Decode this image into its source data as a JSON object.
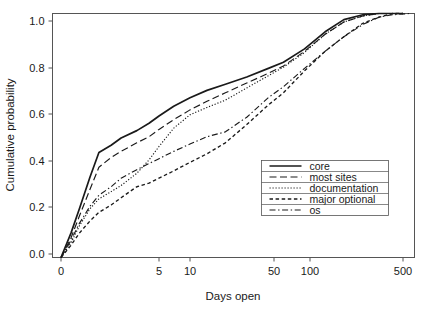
{
  "chart_data": {
    "type": "line",
    "title": "",
    "subtitle": "",
    "xlabel": "Days open",
    "ylabel": "Cumulative probability",
    "grid": false,
    "legend_position": "bottom-right",
    "x_scale": "log-like",
    "xlim": [
      0,
      560
    ],
    "ylim": [
      0.0,
      1.0
    ],
    "x_ticks": [
      {
        "value": 0,
        "label": "0",
        "px": 61
      },
      {
        "value": 5,
        "label": "5",
        "px": 159
      },
      {
        "value": 10,
        "label": "10",
        "px": 190
      },
      {
        "value": 50,
        "label": "50",
        "px": 274
      },
      {
        "value": 100,
        "label": "100",
        "px": 310
      },
      {
        "value": 500,
        "label": "500",
        "px": 403
      }
    ],
    "y_ticks": [
      {
        "value": 0.0,
        "label": "0.0",
        "px": 254
      },
      {
        "value": 0.2,
        "label": "0.2",
        "px": 207
      },
      {
        "value": 0.4,
        "label": "0.4",
        "px": 161
      },
      {
        "value": 0.6,
        "label": "0.6",
        "px": 114
      },
      {
        "value": 0.8,
        "label": "0.8",
        "px": 68
      },
      {
        "value": 1.0,
        "label": "1.0",
        "px": 21
      }
    ],
    "series": [
      {
        "name": "core",
        "dash": "solid",
        "dasharray": "",
        "width": 1.7,
        "x": [
          0,
          0.2,
          0.4,
          0.7,
          1,
          1.5,
          2,
          3,
          4,
          5,
          7,
          10,
          14,
          20,
          30,
          45,
          60,
          90,
          130,
          180,
          250,
          330,
          420,
          500
        ],
        "y": [
          0.0,
          0.1,
          0.2,
          0.33,
          0.43,
          0.46,
          0.49,
          0.52,
          0.55,
          0.58,
          0.62,
          0.655,
          0.685,
          0.71,
          0.74,
          0.775,
          0.8,
          0.855,
          0.925,
          0.975,
          0.995,
          1.0,
          1.0,
          1.0
        ]
      },
      {
        "name": "most sites",
        "dash": "longdash",
        "dasharray": "7,3.5",
        "width": 1.15,
        "x": [
          0,
          0.2,
          0.4,
          0.7,
          1,
          1.5,
          2,
          3,
          4,
          5,
          7,
          10,
          14,
          20,
          30,
          45,
          60,
          90,
          130,
          180,
          250,
          330,
          420,
          500
        ],
        "y": [
          0.0,
          0.08,
          0.17,
          0.28,
          0.37,
          0.41,
          0.435,
          0.47,
          0.495,
          0.525,
          0.565,
          0.605,
          0.64,
          0.675,
          0.715,
          0.755,
          0.785,
          0.845,
          0.915,
          0.965,
          0.99,
          1.0,
          1.0,
          1.0
        ]
      },
      {
        "name": "documentation",
        "dash": "dotted",
        "dasharray": "1.2,1.8",
        "width": 1.15,
        "x": [
          0,
          0.2,
          0.4,
          0.7,
          1,
          1.5,
          2,
          3,
          4,
          5,
          7,
          10,
          14,
          20,
          30,
          45,
          60,
          90,
          130,
          180,
          250,
          330,
          420,
          500
        ],
        "y": [
          0.0,
          0.06,
          0.13,
          0.2,
          0.24,
          0.27,
          0.295,
          0.345,
          0.4,
          0.455,
          0.53,
          0.585,
          0.615,
          0.645,
          0.695,
          0.745,
          0.78,
          0.84,
          0.915,
          0.965,
          0.99,
          1.0,
          1.0,
          1.0
        ]
      },
      {
        "name": "major optional",
        "dash": "dashed",
        "dasharray": "3.5,2.6",
        "width": 1.35,
        "x": [
          0,
          0.2,
          0.4,
          0.7,
          1,
          1.5,
          2,
          3,
          4,
          5,
          7,
          10,
          14,
          20,
          30,
          45,
          60,
          90,
          130,
          180,
          250,
          330,
          420,
          500
        ],
        "y": [
          0.0,
          0.05,
          0.1,
          0.15,
          0.185,
          0.215,
          0.245,
          0.29,
          0.305,
          0.325,
          0.355,
          0.39,
          0.425,
          0.47,
          0.545,
          0.625,
          0.675,
          0.765,
          0.845,
          0.905,
          0.96,
          0.985,
          1.0,
          1.0
        ]
      },
      {
        "name": "os",
        "dash": "dashdot",
        "dasharray": "6,2.6,1.4,2.6",
        "width": 1.15,
        "x": [
          0,
          0.2,
          0.4,
          0.7,
          1,
          1.5,
          2,
          3,
          4,
          5,
          7,
          10,
          14,
          20,
          30,
          45,
          60,
          90,
          130,
          180,
          250,
          330,
          420,
          560
        ],
        "y": [
          0.0,
          0.07,
          0.14,
          0.21,
          0.255,
          0.29,
          0.325,
          0.36,
          0.385,
          0.405,
          0.435,
          0.465,
          0.495,
          0.515,
          0.575,
          0.655,
          0.7,
          0.775,
          0.845,
          0.905,
          0.955,
          0.985,
          0.995,
          1.0
        ]
      }
    ],
    "legend": [
      {
        "label": "core",
        "dash": "solid"
      },
      {
        "label": "most sites",
        "dash": "longdash"
      },
      {
        "label": "documentation",
        "dash": "dotted"
      },
      {
        "label": "major optional",
        "dash": "dashed"
      },
      {
        "label": "os",
        "dash": "dashdot"
      }
    ],
    "colors": {
      "line": "#1a1a1a",
      "frame": "#555555",
      "background": "#ffffff"
    }
  }
}
